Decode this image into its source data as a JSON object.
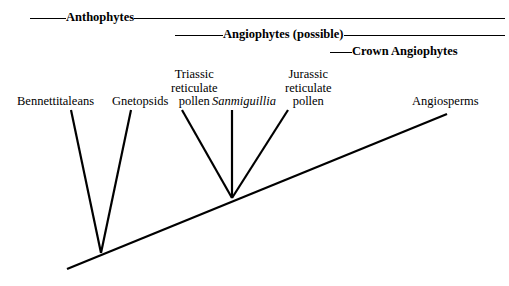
{
  "figure": {
    "type": "cladogram",
    "background": "#ffffff",
    "line_color": "#000000",
    "width": 509,
    "height": 286
  },
  "clade_bars": [
    {
      "id": "anthophytes",
      "label": "Anthophytes",
      "lead_rule": 36,
      "trail_rule": "grow"
    },
    {
      "id": "angiophytes",
      "label": "Angiophytes (possible)",
      "lead_rule": 48,
      "trail_rule": "grow"
    },
    {
      "id": "crown",
      "label": "Crown Angiophytes",
      "lead_rule": 22,
      "trail_rule": "none"
    }
  ],
  "taxa": [
    {
      "id": "bennettitaleans",
      "lines": [
        "Bennettitaleans"
      ],
      "italic": false
    },
    {
      "id": "gnetopsids",
      "lines": [
        "Gnetopsids"
      ],
      "italic": false
    },
    {
      "id": "triassic",
      "lines": [
        "Triassic",
        "reticulate",
        "pollen"
      ],
      "italic": false
    },
    {
      "id": "sanmiguillia",
      "lines": [
        "Sanmiguillia"
      ],
      "italic": true
    },
    {
      "id": "jurassic",
      "lines": [
        "Jurassic",
        "reticulate",
        "pollen"
      ],
      "italic": false
    },
    {
      "id": "angiosperms",
      "lines": [
        "Angiosperms"
      ],
      "italic": false
    }
  ],
  "chart_data": {
    "type": "cladogram",
    "title": "",
    "trunk": {
      "x1": 67,
      "y1": 269,
      "x2": 447,
      "y2": 114
    },
    "nodes": [
      {
        "id": "node-anthophyte",
        "x": 101,
        "y": 253
      },
      {
        "id": "node-angiophyte",
        "x": 232,
        "y": 198
      }
    ],
    "branches": [
      {
        "taxon": "bennettitaleans",
        "from_node": "node-anthophyte",
        "tip_x": 71,
        "tip_y": 110
      },
      {
        "taxon": "gnetopsids",
        "from_node": "node-anthophyte",
        "tip_x": 131,
        "tip_y": 110
      },
      {
        "taxon": "triassic",
        "from_node": "node-angiophyte",
        "tip_x": 182,
        "tip_y": 110
      },
      {
        "taxon": "sanmiguillia",
        "from_node": "node-angiophyte",
        "tip_x": 232,
        "tip_y": 110
      },
      {
        "taxon": "jurassic",
        "from_node": "node-angiophyte",
        "tip_x": 288,
        "tip_y": 110
      }
    ],
    "stroke_width": 2.2
  }
}
